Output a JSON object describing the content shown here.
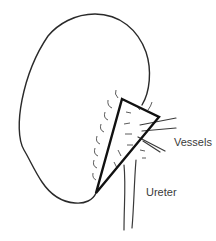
{
  "diagram": {
    "type": "anatomical-sketch",
    "labels": [
      {
        "id": "vessels",
        "text": "Vessels",
        "x": 174,
        "y": 146
      },
      {
        "id": "ureter",
        "text": "Ureter",
        "x": 146,
        "y": 196
      }
    ],
    "colors": {
      "outline": "#2a2a2a",
      "triangle": "#111111",
      "text": "#3a3a3a",
      "background": "#ffffff"
    }
  }
}
